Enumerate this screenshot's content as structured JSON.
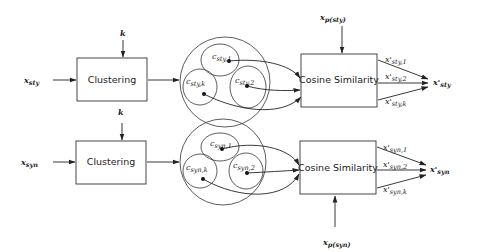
{
  "diagram": {
    "type": "flow",
    "branches": [
      {
        "id": "sty",
        "input": {
          "base": "x",
          "sub": "sty"
        },
        "k_label": "k",
        "clustering_label": "Clustering",
        "clusters": [
          {
            "base": "c",
            "sub": "sty,1"
          },
          {
            "base": "c",
            "sub": "sty,2"
          },
          {
            "base": "c",
            "sub": "sty,k"
          }
        ],
        "similarity_label": "Cosine Similarity",
        "prototype": {
          "base": "x",
          "sub": "p(sty)"
        },
        "outputs": [
          {
            "base": "x'",
            "sub": "sty,1"
          },
          {
            "base": "x'",
            "sub": "sty,2"
          },
          {
            "base": "x'",
            "sub": "sty,k"
          }
        ],
        "result": {
          "base": "x'",
          "sub": "sty"
        }
      },
      {
        "id": "syn",
        "input": {
          "base": "x",
          "sub": "syn"
        },
        "k_label": "k",
        "clustering_label": "Clustering",
        "clusters": [
          {
            "base": "c",
            "sub": "syn,1"
          },
          {
            "base": "c",
            "sub": "syn,2"
          },
          {
            "base": "c",
            "sub": "syn,k"
          }
        ],
        "similarity_label": "Cosine Similarity",
        "prototype": {
          "base": "x",
          "sub": "p(syn)"
        },
        "outputs": [
          {
            "base": "x'",
            "sub": "syn,1"
          },
          {
            "base": "x'",
            "sub": "syn,2"
          },
          {
            "base": "x'",
            "sub": "syn,k"
          }
        ],
        "result": {
          "base": "x'",
          "sub": "syn"
        }
      }
    ]
  }
}
